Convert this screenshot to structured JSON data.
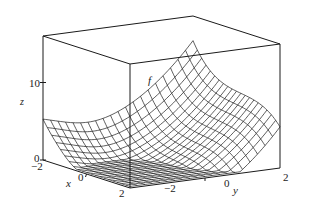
{
  "chart_data": {
    "type": "surface3d",
    "title": "",
    "function_label": "f",
    "xlabel": "x",
    "ylabel": "y",
    "zlabel": "z",
    "x_ticks": [
      "-2",
      "0",
      "2"
    ],
    "y_ticks": [
      "-2",
      "0",
      "2"
    ],
    "z_ticks": [
      "0",
      "10"
    ],
    "xlim": [
      -2,
      2
    ],
    "ylim": [
      -2,
      2
    ],
    "zlim": [
      0,
      16
    ],
    "grid_lines_per_axis": 20,
    "surface_description": "wireframe mesh surface; dips to ~0 near x=2,y=0, rises to ~16 at the x=-2,y=2 corner, with a hump near x=-2,y=-2",
    "box": true,
    "legend": "none"
  },
  "labels": {
    "z_axis": "z",
    "x_axis": "x",
    "y_axis": "y",
    "f_label": "f",
    "z_tick_0": "0",
    "z_tick_10": "10",
    "x_tick_neg2": "−2",
    "x_tick_0": "0",
    "x_tick_2": "2",
    "y_tick_neg2": "−2",
    "y_tick_0": "0",
    "y_tick_2": "2"
  },
  "colors": {
    "line": "#1a1a1a",
    "background": "#ffffff"
  }
}
